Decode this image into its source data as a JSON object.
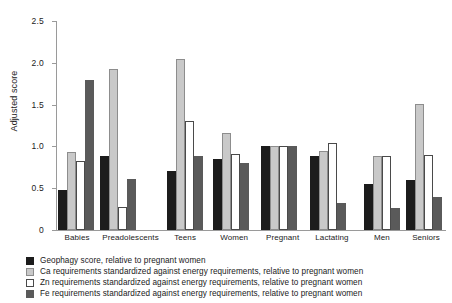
{
  "chart_data": {
    "type": "bar",
    "title": "",
    "xlabel": "",
    "ylabel": "Adjusted score",
    "ylim": [
      0,
      2.5
    ],
    "yticks": [
      "0",
      "0.5",
      "1.0",
      "1.5",
      "2.0",
      "2.5"
    ],
    "ytick_values": [
      0,
      0.5,
      1.0,
      1.5,
      2.0,
      2.5
    ],
    "grid": false,
    "legend_position": "bottom-left",
    "categories": [
      "Babies",
      "Preadolescents",
      "Teens",
      "Women",
      "Pregnant",
      "Lactating",
      "Men",
      "Seniors"
    ],
    "series": [
      {
        "name": "Geophagy score, relative to pregnant women",
        "color": "#1c1c1c",
        "values": [
          0.48,
          0.88,
          0.71,
          0.85,
          1.0,
          0.88,
          0.55,
          0.6
        ]
      },
      {
        "name": "Ca requirements standardized against energy requirements, relative to pregnant women",
        "color": "#c9c9c9",
        "values": [
          0.93,
          1.93,
          2.04,
          1.16,
          1.0,
          0.95,
          0.88,
          1.51
        ]
      },
      {
        "name": "Zn requirements standardized against energy requirements, relative to pregnant women",
        "color": "#ffffff",
        "values": [
          0.82,
          0.27,
          1.3,
          0.91,
          1.0,
          1.04,
          0.88,
          0.9
        ]
      },
      {
        "name": "Fe requirements standardized against energy requirements, relative to pregnant women",
        "color": "#5a5a5a",
        "values": [
          1.8,
          0.61,
          0.88,
          0.8,
          1.0,
          0.32,
          0.26,
          0.4
        ]
      }
    ]
  },
  "legend": {
    "items": [
      {
        "swatch": "s0",
        "label": "Geophagy score, relative to pregnant women"
      },
      {
        "swatch": "s1",
        "label": "Ca requirements standardized against energy requirements, relative to pregnant women"
      },
      {
        "swatch": "s2",
        "label": "Zn requirements standardized against energy requirements, relative to pregnant women"
      },
      {
        "swatch": "s3",
        "label": "Fe requirements standardized against energy requirements, relative to pregnant women"
      }
    ]
  }
}
